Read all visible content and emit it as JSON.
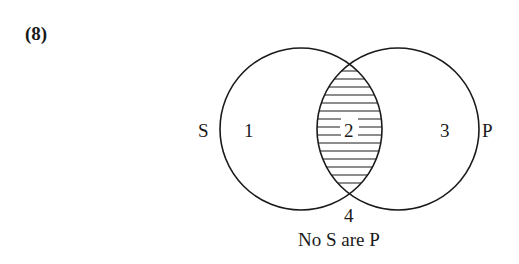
{
  "problem": {
    "number": "(8)"
  },
  "diagram": {
    "type": "venn",
    "sets": [
      {
        "name": "S",
        "label": "S",
        "cx": 301,
        "cy": 129,
        "r": 81
      },
      {
        "name": "P",
        "label": "P",
        "cx": 398,
        "cy": 129,
        "r": 81
      }
    ],
    "regions": [
      {
        "id": "1",
        "label": "1",
        "description": "S only",
        "shaded": false
      },
      {
        "id": "2",
        "label": "2",
        "description": "S and P",
        "shaded": true,
        "shading": "horizontal-lines"
      },
      {
        "id": "3",
        "label": "3",
        "description": "P only",
        "shaded": false
      },
      {
        "id": "4",
        "label": "4",
        "description": "outside both",
        "shaded": false
      }
    ],
    "caption": "No S are P",
    "colors": {
      "stroke": "#1a1a1a",
      "background": "#ffffff"
    }
  }
}
